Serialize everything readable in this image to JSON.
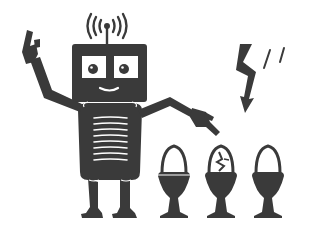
{
  "scene": {
    "description": "Robot pointing at three eggs in egg cups, one egg cracked, lightning bolt above",
    "colors": {
      "ink": "#3a3a3a",
      "background": "#ffffff"
    }
  },
  "icons": {
    "robot": "robot-icon",
    "antenna_signal": "signal-waves-icon",
    "lightning": "lightning-bolt-icon",
    "egg_cups": [
      "egg-cup-icon",
      "cracked-egg-cup-icon",
      "egg-cup-icon"
    ]
  }
}
